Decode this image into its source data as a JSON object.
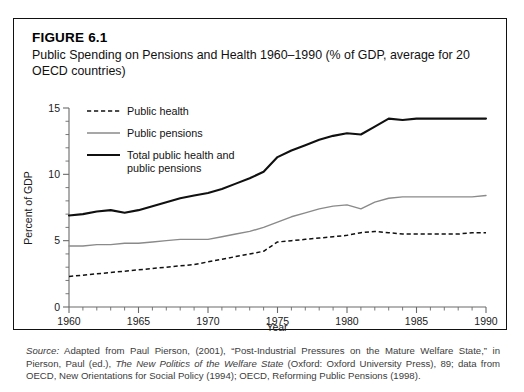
{
  "figure": {
    "label": "FIGURE 6.1",
    "title": "Public Spending on Pensions and Health 1960–1990 (% of GDP, average for 20 OECD countries)"
  },
  "source": {
    "lead": "Source:",
    "text_1": " Adapted from Paul Pierson, (2001), “Post-Industrial Pressures on the Mature Welfare State,” in Pierson, Paul (ed.), ",
    "italic_1": "The New Politics of the Welfare State",
    "text_2": " (Oxford: Oxford University Press), 89; data from OECD, New Orientations for Social Policy (1994); OECD, Reforming Public Pensions (1998)."
  },
  "chart_data": {
    "type": "line",
    "title": "Public Spending on Pensions and Health 1960–1990 (% of GDP, average for 20 OECD countries)",
    "xlabel": "Year",
    "ylabel": "Percent of GDP",
    "xlim": [
      1960,
      1990
    ],
    "ylim": [
      0,
      15
    ],
    "x_major_ticks": [
      1960,
      1965,
      1970,
      1975,
      1980,
      1985,
      1990
    ],
    "x_minor_step": 1,
    "y_major_ticks": [
      0,
      5,
      10,
      15
    ],
    "y_minor_step": 1,
    "grid": false,
    "legend_position": "top-left",
    "x": [
      1960,
      1961,
      1962,
      1963,
      1964,
      1965,
      1966,
      1967,
      1968,
      1969,
      1970,
      1971,
      1972,
      1973,
      1974,
      1975,
      1976,
      1977,
      1978,
      1979,
      1980,
      1981,
      1982,
      1983,
      1984,
      1985,
      1986,
      1987,
      1988,
      1989,
      1990
    ],
    "series": [
      {
        "name": "Public health",
        "style": "dashed",
        "color": "#101010",
        "values": [
          2.3,
          2.4,
          2.5,
          2.6,
          2.7,
          2.8,
          2.9,
          3.0,
          3.1,
          3.2,
          3.4,
          3.6,
          3.8,
          4.0,
          4.2,
          4.9,
          5.0,
          5.1,
          5.2,
          5.3,
          5.4,
          5.6,
          5.7,
          5.6,
          5.5,
          5.5,
          5.5,
          5.5,
          5.5,
          5.6,
          5.6
        ]
      },
      {
        "name": "Public pensions",
        "style": "solid-light",
        "color": "#8a8a8a",
        "values": [
          4.6,
          4.6,
          4.7,
          4.7,
          4.8,
          4.8,
          4.9,
          5.0,
          5.1,
          5.1,
          5.1,
          5.3,
          5.5,
          5.7,
          6.0,
          6.4,
          6.8,
          7.1,
          7.4,
          7.6,
          7.7,
          7.4,
          7.9,
          8.2,
          8.3,
          8.3,
          8.3,
          8.3,
          8.3,
          8.3,
          8.4
        ]
      },
      {
        "name": "Total public health and public pensions",
        "style": "solid-heavy",
        "color": "#101010",
        "values": [
          6.9,
          7.0,
          7.2,
          7.3,
          7.1,
          7.3,
          7.6,
          7.9,
          8.2,
          8.4,
          8.6,
          8.9,
          9.3,
          9.7,
          10.2,
          11.3,
          11.8,
          12.2,
          12.6,
          12.9,
          13.1,
          13.0,
          13.6,
          14.2,
          14.1,
          14.2,
          14.2,
          14.2,
          14.2,
          14.2,
          14.2
        ]
      }
    ],
    "legend_entries": [
      {
        "label": "Public health"
      },
      {
        "label": "Public pensions"
      },
      {
        "label_line1": "Total public health and",
        "label_line2": "public pensions"
      }
    ]
  }
}
